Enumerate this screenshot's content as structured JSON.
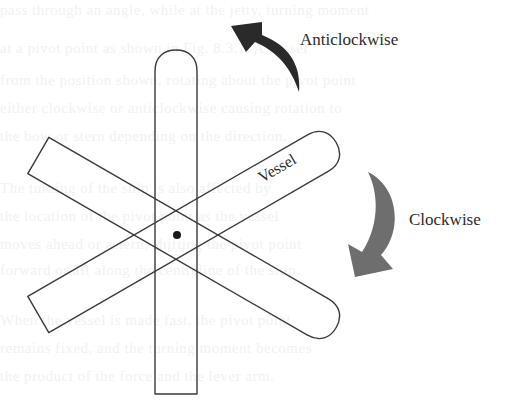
{
  "diagram": {
    "labels": {
      "anticlockwise": "Anticlockwise",
      "clockwise": "Clockwise",
      "vessel": "Vessel"
    },
    "vessels": [
      {
        "name": "vessel-vertical",
        "angle_deg": 0
      },
      {
        "name": "vessel-rotated-clockwise",
        "angle_deg": 60
      },
      {
        "name": "vessel-rotated-anticlockwise",
        "angle_deg": 120
      }
    ],
    "pivot": {
      "x": 176,
      "y": 235
    },
    "colors": {
      "outline": "#3a3a3a",
      "anticlockwise_arrow": "#2a2a2a",
      "clockwise_arrow": "#6e6e6e",
      "pivot_dot": "#1a1a1a",
      "background": "#ffffff"
    }
  },
  "background_text": [
    "pass through an angle, while at the jetty, turning moment",
    "at a pivot point as shown in Fig. 8.3.1. A vessel",
    "from the position shown, rotating about the pivot point",
    "either clockwise or anticlockwise causing rotation to",
    "the bow or stern depending on the direction.",
    "The turning of the ship is also affected by",
    "the location of the pivot point as the vessel",
    "moves ahead or astern, shifting the pivot point",
    "forward or aft along the centreline of the ship.",
    "When the vessel is made fast, the pivot point",
    "remains fixed, and the turning moment becomes",
    "the product of the force and the lever arm."
  ]
}
